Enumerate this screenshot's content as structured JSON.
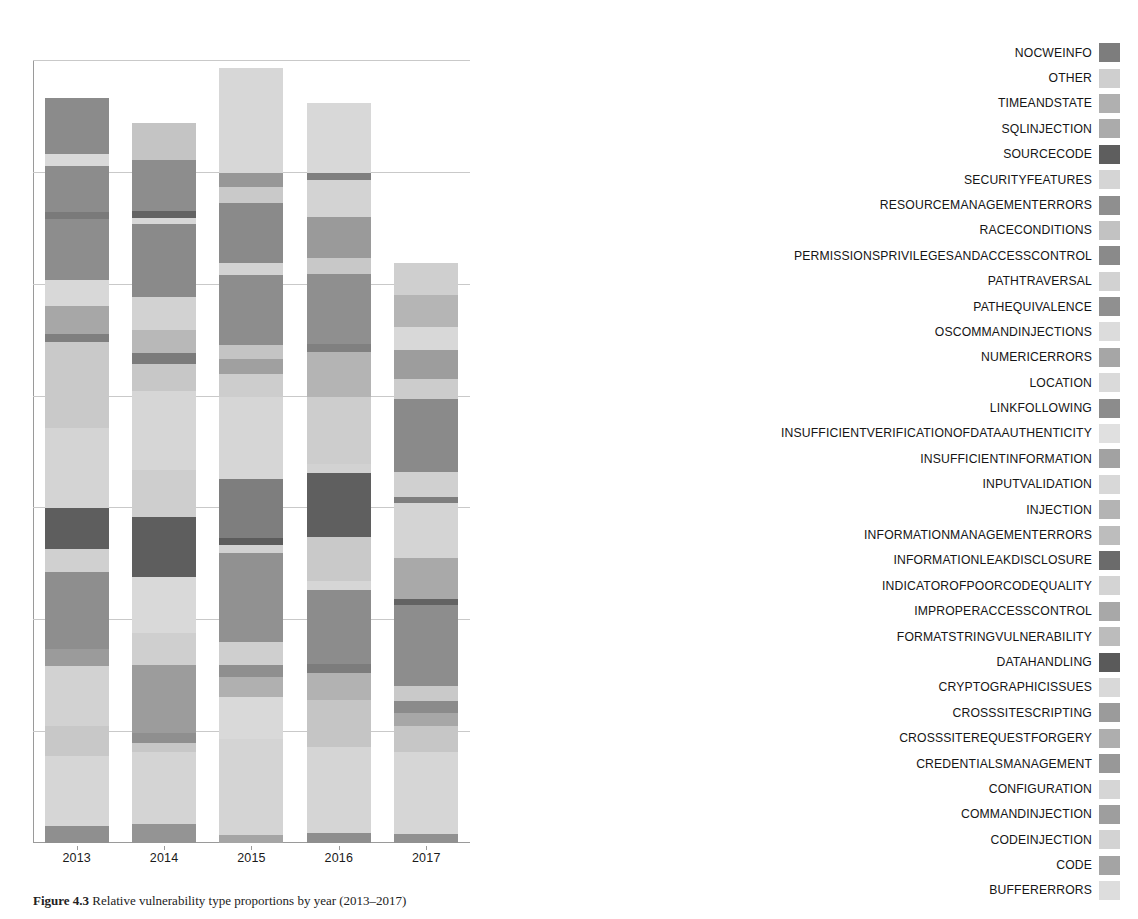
{
  "figure": {
    "caption_label": "Figure 4.3",
    "caption_text": "Relative vulnerability type proportions by year (2013–2017)"
  },
  "axis": {
    "x_ticks": [
      "2013",
      "2014",
      "2015",
      "2016",
      "2017"
    ],
    "y_gridlines": [
      0,
      1,
      2,
      3,
      4,
      5,
      6,
      7
    ],
    "grid": true
  },
  "legend": {
    "position": "right",
    "items": [
      {
        "label": "NOCWEINFO",
        "color": "#7d7d7d"
      },
      {
        "label": "OTHER",
        "color": "#cfcfcf"
      },
      {
        "label": "TIMEANDSTATE",
        "color": "#b0b0b0"
      },
      {
        "label": "SQLINJECTION",
        "color": "#ababab"
      },
      {
        "label": "SOURCECODE",
        "color": "#5e5e5e"
      },
      {
        "label": "SECURITYFEATURES",
        "color": "#d5d5d5"
      },
      {
        "label": "RESOURCEMANAGEMENTERRORS",
        "color": "#8f8f8f"
      },
      {
        "label": "RACECONDITIONS",
        "color": "#c2c2c2"
      },
      {
        "label": "PERMISSIONSPRIVILEGESANDACCESSCONTROL",
        "color": "#8a8a8a"
      },
      {
        "label": "PATHTRAVERSAL",
        "color": "#d2d2d2"
      },
      {
        "label": "PATHEQUIVALENCE",
        "color": "#909090"
      },
      {
        "label": "OSCOMMANDINJECTIONS",
        "color": "#dcdcdc"
      },
      {
        "label": "NUMERICERRORS",
        "color": "#a6a6a6"
      },
      {
        "label": "LOCATION",
        "color": "#dadada"
      },
      {
        "label": "LINKFOLLOWING",
        "color": "#8c8c8c"
      },
      {
        "label": "INSUFFICIENTVERIFICATIONOFDATAAUTHENTICITY",
        "color": "#e0e0e0"
      },
      {
        "label": "INSUFFICIENTINFORMATION",
        "color": "#a2a2a2"
      },
      {
        "label": "INPUTVALIDATION",
        "color": "#d8d8d8"
      },
      {
        "label": "INJECTION",
        "color": "#b4b4b4"
      },
      {
        "label": "INFORMATIONMANAGEMENTERRORS",
        "color": "#bdbdbd"
      },
      {
        "label": "INFORMATIONLEAKDISCLOSURE",
        "color": "#6b6b6b"
      },
      {
        "label": "INDICATOROFPOORCODEQUALITY",
        "color": "#d4d4d4"
      },
      {
        "label": "IMPROPERACCESSCONTROL",
        "color": "#a8a8a8"
      },
      {
        "label": "FORMATSTRINGVULNERABILITY",
        "color": "#bcbcbc"
      },
      {
        "label": "DATAHANDLING",
        "color": "#5a5a5a"
      },
      {
        "label": "CRYPTOGRAPHICISSUES",
        "color": "#d9d9d9"
      },
      {
        "label": "CROSSSITESCRIPTING",
        "color": "#9b9b9b"
      },
      {
        "label": "CROSSSITEREQUESTFORGERY",
        "color": "#aeaeae"
      },
      {
        "label": "CREDENTIALSMANAGEMENT",
        "color": "#989898"
      },
      {
        "label": "CONFIGURATION",
        "color": "#d6d6d6"
      },
      {
        "label": "COMMANDINJECTION",
        "color": "#9e9e9e"
      },
      {
        "label": "CODEINJECTION",
        "color": "#d3d3d3"
      },
      {
        "label": "CODE",
        "color": "#a4a4a4"
      },
      {
        "label": "BUFFERERRORS",
        "color": "#dddddd"
      }
    ]
  },
  "chart_data": {
    "type": "bar",
    "stacked": true,
    "orientation": "vertical",
    "title": "",
    "xlabel": "",
    "ylabel": "",
    "categories": [
      "2013",
      "2014",
      "2015",
      "2016",
      "2017"
    ],
    "bar_totals_px": [
      745,
      720,
      775,
      740,
      580
    ],
    "bars": [
      {
        "category": "2013",
        "segments": [
          {
            "label": "BUFFERERRORS",
            "color": "#8f8f8f",
            "value": 2.2
          },
          {
            "label": "CODE",
            "color": "#d6d6d6",
            "value": 9.4
          },
          {
            "label": "CODEINJECTION",
            "color": "#c8c8c8",
            "value": 4.1
          },
          {
            "label": "COMMANDINJECTION",
            "color": "#d2d2d2",
            "value": 8.0
          },
          {
            "label": "CONFIGURATION",
            "color": "#9b9b9b",
            "value": 2.3
          },
          {
            "label": "CREDENTIALSMANAGEMENT",
            "color": "#8e8e8e",
            "value": 10.4
          },
          {
            "label": "CROSSSITEREQUESTFORGERY",
            "color": "#d0d0d0",
            "value": 3.1
          },
          {
            "label": "CROSSSITESCRIPTING",
            "color": "#5e5e5e",
            "value": 5.4
          },
          {
            "label": "CRYPTOGRAPHICISSUES",
            "color": "#d4d4d4",
            "value": 10.8
          },
          {
            "label": "DATAHANDLING",
            "color": "#c9c9c9",
            "value": 11.5
          },
          {
            "label": "FORMATSTRINGVULNERABILITY",
            "color": "#7f7f7f",
            "value": 1.1
          },
          {
            "label": "IMPROPERACCESSCONTROL",
            "color": "#a7a7a7",
            "value": 3.8
          },
          {
            "label": "INDICATOROFPOORCODEQUALITY",
            "color": "#d8d8d8",
            "value": 3.4
          },
          {
            "label": "INFORMATIONLEAKDISCLOSURE",
            "color": "#8d8d8d",
            "value": 8.2
          },
          {
            "label": "INFORMATIONMANAGEMENTERRORS",
            "color": "#7a7a7a",
            "value": 1.0
          },
          {
            "label": "INJECTION",
            "color": "#8c8c8c",
            "value": 6.2
          },
          {
            "label": "INPUTVALIDATION",
            "color": "#d9d9d9",
            "value": 1.6
          },
          {
            "label": "INSUFFICIENTINFORMATION",
            "color": "#8b8b8b",
            "value": 7.5
          }
        ]
      },
      {
        "category": "2014",
        "segments": [
          {
            "label": "BUFFERERRORS",
            "color": "#949494",
            "value": 2.6
          },
          {
            "label": "CODE",
            "color": "#d4d4d4",
            "value": 10.0
          },
          {
            "label": "CODEINJECTION",
            "color": "#c7c7c7",
            "value": 1.3
          },
          {
            "label": "COMMANDINJECTION",
            "color": "#8f8f8f",
            "value": 1.3
          },
          {
            "label": "CONFIGURATION",
            "color": "#9c9c9c",
            "value": 9.5
          },
          {
            "label": "CREDENTIALSMANAGEMENT",
            "color": "#cfcfcf",
            "value": 4.5
          },
          {
            "label": "CROSSSITEREQUESTFORGERY",
            "color": "#d9d9d9",
            "value": 7.7
          },
          {
            "label": "CROSSSITESCRIPTING",
            "color": "#5e5e5e",
            "value": 8.3
          },
          {
            "label": "CRYPTOGRAPHICISSUES",
            "color": "#cecece",
            "value": 6.6
          },
          {
            "label": "DATAHANDLING",
            "color": "#d6d6d6",
            "value": 11.0
          },
          {
            "label": "FORMATSTRINGVULNERABILITY",
            "color": "#c7c7c7",
            "value": 3.7
          },
          {
            "label": "IMPROPERACCESSCONTROL",
            "color": "#7b7b7b",
            "value": 1.5
          },
          {
            "label": "INDICATOROFPOORCODEQUALITY",
            "color": "#b8b8b8",
            "value": 3.3
          },
          {
            "label": "INFORMATIONLEAKDISCLOSURE",
            "color": "#d2d2d2",
            "value": 4.5
          },
          {
            "label": "INFORMATIONMANAGEMENTERRORS",
            "color": "#8a8a8a",
            "value": 10.2
          },
          {
            "label": "INJECTION",
            "color": "#d7d7d7",
            "value": 0.8
          },
          {
            "label": "INPUTVALIDATION",
            "color": "#636363",
            "value": 1.0
          },
          {
            "label": "INSUFFICIENTINFORMATION",
            "color": "#8d8d8d",
            "value": 7.0
          },
          {
            "label": "LINKFOLLOWING",
            "color": "#c4c4c4",
            "value": 5.2
          }
        ]
      },
      {
        "category": "2015",
        "segments": [
          {
            "label": "BUFFERERRORS",
            "color": "#a5a5a5",
            "value": 1.0
          },
          {
            "label": "CODE",
            "color": "#d4d4d4",
            "value": 12.4
          },
          {
            "label": "CODEINJECTION",
            "color": "#d9d9d9",
            "value": 5.4
          },
          {
            "label": "COMMANDINJECTION",
            "color": "#b0b0b0",
            "value": 2.6
          },
          {
            "label": "CONFIGURATION",
            "color": "#8f8f8f",
            "value": 1.5
          },
          {
            "label": "CREDENTIALSMANAGEMENT",
            "color": "#cfcfcf",
            "value": 3.0
          },
          {
            "label": "CROSSSITEREQUESTFORGERY",
            "color": "#919191",
            "value": 11.5
          },
          {
            "label": "CROSSSITESCRIPTING",
            "color": "#d1d1d1",
            "value": 1.0
          },
          {
            "label": "CRYPTOGRAPHICISSUES",
            "color": "#5c5c5c",
            "value": 1.0
          },
          {
            "label": "DATAHANDLING",
            "color": "#7e7e7e",
            "value": 7.5
          },
          {
            "label": "FORMATSTRINGVULNERABILITY",
            "color": "#d6d6d6",
            "value": 10.6
          },
          {
            "label": "IMPROPERACCESSCONTROL",
            "color": "#cdcdcd",
            "value": 3.0
          },
          {
            "label": "INDICATOROFPOORCODEQUALITY",
            "color": "#a0a0a0",
            "value": 2.0
          },
          {
            "label": "INFORMATIONLEAKDISCLOSURE",
            "color": "#c4c4c4",
            "value": 1.8
          },
          {
            "label": "INFORMATIONMANAGEMENTERRORS",
            "color": "#8d8d8d",
            "value": 9.0
          },
          {
            "label": "INJECTION",
            "color": "#d3d3d3",
            "value": 1.5
          },
          {
            "label": "INPUTVALIDATION",
            "color": "#8a8a8a",
            "value": 7.8
          },
          {
            "label": "INSUFFICIENTINFORMATION",
            "color": "#c9c9c9",
            "value": 2.0
          },
          {
            "label": "LINKFOLLOWING",
            "color": "#979797",
            "value": 1.8
          },
          {
            "label": "LOCATION",
            "color": "#d7d7d7",
            "value": 13.6
          }
        ]
      },
      {
        "category": "2016",
        "segments": [
          {
            "label": "BUFFERERRORS",
            "color": "#8e8e8e",
            "value": 1.4
          },
          {
            "label": "CODE",
            "color": "#d5d5d5",
            "value": 11.5
          },
          {
            "label": "CODEINJECTION",
            "color": "#c5c5c5",
            "value": 6.4
          },
          {
            "label": "COMMANDINJECTION",
            "color": "#b2b2b2",
            "value": 3.6
          },
          {
            "label": "CONFIGURATION",
            "color": "#7c7c7c",
            "value": 1.3
          },
          {
            "label": "CREDENTIALSMANAGEMENT",
            "color": "#8c8c8c",
            "value": 10.0
          },
          {
            "label": "CROSSSITEREQUESTFORGERY",
            "color": "#d6d6d6",
            "value": 1.2
          },
          {
            "label": "CROSSSITESCRIPTING",
            "color": "#c9c9c9",
            "value": 6.0
          },
          {
            "label": "CRYPTOGRAPHICISSUES",
            "color": "#5f5f5f",
            "value": 8.6
          },
          {
            "label": "DATAHANDLING",
            "color": "#d2d2d2",
            "value": 1.2
          },
          {
            "label": "FORMATSTRINGVULNERABILITY",
            "color": "#cdcdcd",
            "value": 9.0
          },
          {
            "label": "IMPROPERACCESSCONTROL",
            "color": "#b4b4b4",
            "value": 6.2
          },
          {
            "label": "INDICATOROFPOORCODEQUALITY",
            "color": "#808080",
            "value": 1.0
          },
          {
            "label": "INFORMATIONLEAKDISCLOSURE",
            "color": "#8f8f8f",
            "value": 9.5
          },
          {
            "label": "INFORMATIONMANAGEMENTERRORS",
            "color": "#c8c8c8",
            "value": 2.2
          },
          {
            "label": "INJECTION",
            "color": "#9a9a9a",
            "value": 5.5
          },
          {
            "label": "INPUTVALIDATION",
            "color": "#d3d3d3",
            "value": 5.0
          },
          {
            "label": "INSUFFICIENTINFORMATION",
            "color": "#7f7f7f",
            "value": 1.0
          },
          {
            "label": "LINKFOLLOWING",
            "color": "#d8d8d8",
            "value": 9.4
          }
        ]
      },
      {
        "category": "2017",
        "segments": [
          {
            "label": "BUFFERERRORS",
            "color": "#919191",
            "value": 1.6
          },
          {
            "label": "CODE",
            "color": "#d6d6d6",
            "value": 14.0
          },
          {
            "label": "CODEINJECTION",
            "color": "#c6c6c6",
            "value": 4.5
          },
          {
            "label": "COMMANDINJECTION",
            "color": "#a7a7a7",
            "value": 2.3
          },
          {
            "label": "CONFIGURATION",
            "color": "#8b8b8b",
            "value": 2.0
          },
          {
            "label": "CREDENTIALSMANAGEMENT",
            "color": "#c9c9c9",
            "value": 2.7
          },
          {
            "label": "CROSSSITESCRIPTING",
            "color": "#8d8d8d",
            "value": 14.0
          },
          {
            "label": "CRYPTOGRAPHICISSUES",
            "color": "#636363",
            "value": 1.0
          },
          {
            "label": "DATAHANDLING",
            "color": "#a9a9a9",
            "value": 7.0
          },
          {
            "label": "FORMATSTRINGVULNERABILITY",
            "color": "#d4d4d4",
            "value": 9.5
          },
          {
            "label": "IMPROPERACCESSCONTROL",
            "color": "#7e7e7e",
            "value": 1.0
          },
          {
            "label": "INDICATOROFPOORCODEQUALITY",
            "color": "#d0d0d0",
            "value": 4.4
          },
          {
            "label": "INFORMATIONLEAKDISCLOSURE",
            "color": "#8a8a8a",
            "value": 12.5
          },
          {
            "label": "INFORMATIONMANAGEMENTERRORS",
            "color": "#cccccc",
            "value": 3.5
          },
          {
            "label": "INJECTION",
            "color": "#9d9d9d",
            "value": 5.0
          },
          {
            "label": "INPUTVALIDATION",
            "color": "#d8d8d8",
            "value": 4.0
          },
          {
            "label": "INSUFFICIENTINFORMATION",
            "color": "#b5b5b5",
            "value": 5.5
          },
          {
            "label": "LINKFOLLOWING",
            "color": "#cfcfcf",
            "value": 5.5
          }
        ]
      }
    ]
  }
}
